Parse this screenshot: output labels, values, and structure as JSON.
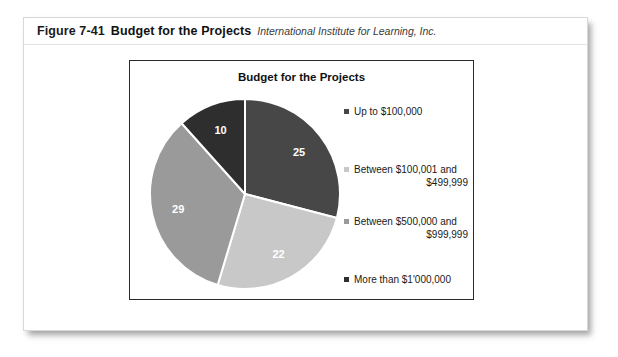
{
  "caption": {
    "figure_number": "Figure 7-41",
    "title": "Budget for the Projects",
    "source": "International Institute for Learning, Inc."
  },
  "chart_data": {
    "type": "pie",
    "title": "Budget for the Projects",
    "categories": [
      "Up to $100,000",
      "Between $100,001 and $499,999",
      "Between $500,000 and $999,999",
      "More than $1'000,000"
    ],
    "values": [
      25,
      22,
      29,
      10
    ],
    "data_labels": [
      "25",
      "22",
      "29",
      "10"
    ],
    "colors": [
      "#474747",
      "#c8c8c8",
      "#9a9a9a",
      "#2e2e2e"
    ],
    "legend_position": "right",
    "grid": false,
    "xlabel": "",
    "ylabel": ""
  },
  "legend": {
    "entries": [
      {
        "color": "#474747",
        "line1": "Up to $100,000",
        "line2": ""
      },
      {
        "color": "#c8c8c8",
        "line1": "Between $100,001 and",
        "line2": "$499,999"
      },
      {
        "color": "#9a9a9a",
        "line1": "Between $500,000 and",
        "line2": "$999,999"
      },
      {
        "color": "#2e2e2e",
        "line1": "More than $1'000,000",
        "line2": ""
      }
    ]
  }
}
